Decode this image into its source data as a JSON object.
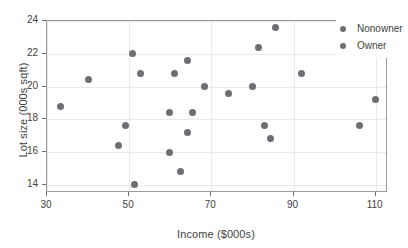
{
  "chart_data": {
    "type": "scatter",
    "title": "",
    "xlabel": "Income ($000s)",
    "ylabel": "Lot size (000s sqft)",
    "xlim": [
      30,
      113
    ],
    "ylim": [
      13.5,
      24
    ],
    "xticks": [
      30,
      50,
      70,
      90,
      110
    ],
    "yticks": [
      14,
      16,
      18,
      20,
      22,
      24
    ],
    "grid": true,
    "legend_position": "top-right",
    "marker_color": "#6e6e73",
    "series": [
      {
        "name": "Nonowner",
        "color": "#6e6e73",
        "points": [
          [
            33.4,
            18.8
          ],
          [
            49.2,
            17.6
          ],
          [
            47.4,
            16.4
          ],
          [
            51.3,
            14.0
          ],
          [
            59.8,
            16.0
          ],
          [
            62.6,
            14.8
          ],
          [
            64.3,
            17.2
          ],
          [
            59.7,
            18.4
          ],
          [
            65.4,
            18.4
          ],
          [
            83.0,
            17.6
          ],
          [
            84.4,
            16.8
          ],
          [
            106.0,
            17.6
          ]
        ]
      },
      {
        "name": "Owner",
        "color": "#6e6e73",
        "points": [
          [
            40.0,
            20.4
          ],
          [
            50.8,
            22.0
          ],
          [
            52.8,
            20.8
          ],
          [
            61.1,
            20.8
          ],
          [
            64.2,
            21.6
          ],
          [
            68.3,
            20.0
          ],
          [
            74.1,
            19.6
          ],
          [
            79.9,
            20.0
          ],
          [
            81.6,
            22.4
          ],
          [
            85.6,
            23.6
          ],
          [
            91.9,
            20.8
          ],
          [
            110.0,
            19.2
          ]
        ]
      }
    ]
  },
  "legend": {
    "entries": [
      {
        "label": "Nonowner",
        "color": "#6e6e73"
      },
      {
        "label": "Owner",
        "color": "#6e6e73"
      }
    ]
  }
}
